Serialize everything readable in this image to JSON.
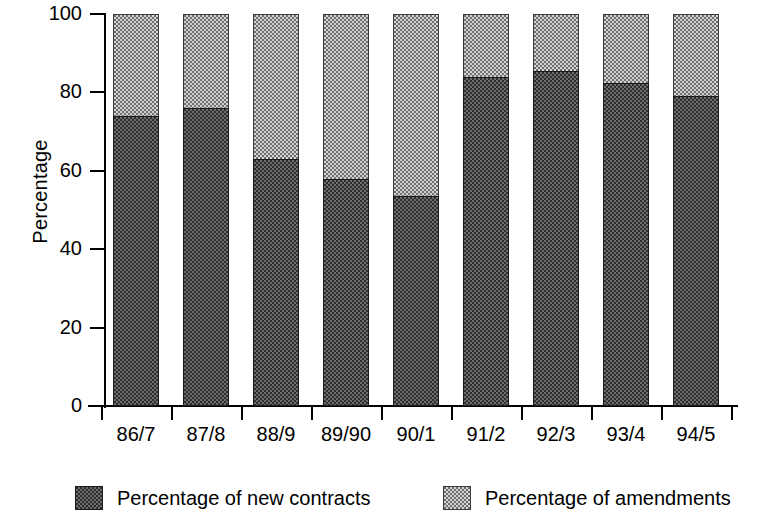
{
  "chart_data": {
    "type": "bar",
    "subtype": "stacked-bar-100",
    "title": "",
    "xlabel": "",
    "ylabel": "Percentage",
    "ylim": [
      0,
      100
    ],
    "yticks": [
      0,
      20,
      40,
      60,
      80,
      100
    ],
    "ytick_labels": [
      "0",
      "20",
      "40",
      "60",
      "80",
      "100"
    ],
    "grid": false,
    "legend_position": "bottom",
    "categories": [
      "86/7",
      "87/8",
      "88/9",
      "89/90",
      "90/1",
      "91/2",
      "92/3",
      "93/4",
      "94/5"
    ],
    "series": [
      {
        "name": "Percentage of new contracts",
        "fill": "dark-checker",
        "color": "#2e2e2e",
        "values": [
          74,
          76,
          63,
          58,
          53.5,
          84,
          85.5,
          82.5,
          79
        ]
      },
      {
        "name": "Percentage of amendments",
        "fill": "light-dotted",
        "color": "#d2d2d2",
        "values": [
          26,
          24,
          37,
          42,
          46.5,
          16,
          14.5,
          17.5,
          21
        ]
      }
    ]
  },
  "legend": {
    "items": [
      {
        "label": "Percentage of new contracts",
        "swatch": "dark-checker-swatch"
      },
      {
        "label": "Percentage of amendments",
        "swatch": "light-dotted-swatch"
      }
    ]
  }
}
